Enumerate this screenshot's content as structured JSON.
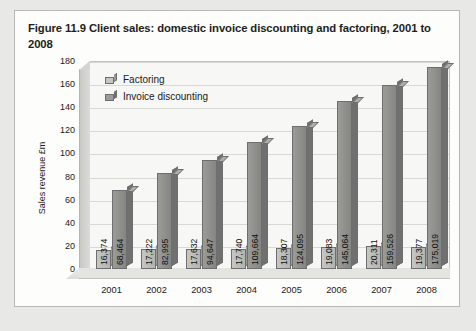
{
  "figure": {
    "title": "Figure 11.9  Client sales: domestic invoice discounting and factoring, 2001 to 2008"
  },
  "chart_data": {
    "type": "bar",
    "title": "Client sales: domestic invoice discounting and factoring, 2001 to 2008",
    "xlabel": "",
    "ylabel": "Sales revenue £m",
    "categories": [
      "2001",
      "2002",
      "2003",
      "2004",
      "2005",
      "2006",
      "2007",
      "2008"
    ],
    "ylim": [
      0,
      180
    ],
    "yticks": [
      0,
      20,
      40,
      60,
      80,
      100,
      120,
      140,
      160,
      180
    ],
    "grid": true,
    "legend_position": "top-left",
    "series": [
      {
        "name": "Factoring",
        "color": "#b4b4b0",
        "values": [
          16.374,
          17.222,
          17.632,
          17.74,
          18.307,
          19.083,
          20.311,
          19.377
        ],
        "labels": [
          "16,374",
          "17,222",
          "17,632",
          "17,740",
          "18,307",
          "19,083",
          "20,311",
          "19,377"
        ]
      },
      {
        "name": "Invoice discounting",
        "color": "#858582",
        "values": [
          68.464,
          82.995,
          94.647,
          109.664,
          124.095,
          145.064,
          159.526,
          175.019
        ],
        "labels": [
          "68,464",
          "82,995",
          "94,647",
          "109,664",
          "124,095",
          "145,064",
          "159,526",
          "175,019"
        ]
      }
    ]
  }
}
